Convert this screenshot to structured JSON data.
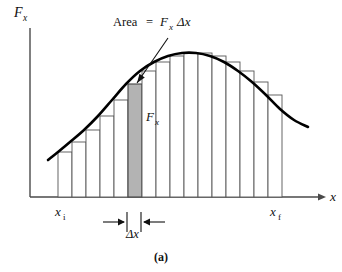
{
  "figure": {
    "caption": "(a)",
    "axis": {
      "y_label": "F",
      "y_label_sub": "x",
      "x_label": "x"
    },
    "annotations": {
      "area_label_prefix": "Area",
      "area_label_equals": "=",
      "area_label_force": "F",
      "area_label_force_sub": "x",
      "area_label_delta": "Δx",
      "bar_force_label": "F",
      "bar_force_label_sub": "x",
      "delta_x_label": "Δx",
      "x_initial": "x",
      "x_initial_sub": "i",
      "x_final": "x",
      "x_final_sub": "f"
    },
    "colors": {
      "curve": "#000000",
      "bar_outline": "#555555",
      "bar_fill": "#ffffff",
      "highlight_fill": "#b3b3b3",
      "highlight_outline": "#444444",
      "axis": "#4a4a4a",
      "text": "#111111",
      "background": "#ffffff"
    }
  },
  "chart_data": {
    "type": "area",
    "title": "",
    "xlabel": "x",
    "ylabel": "Fx",
    "grid": false,
    "legend": "none",
    "xlim": [
      0,
      342
    ],
    "ylim": [
      0,
      272
    ],
    "baseline_y": 197,
    "axis_origin": [
      30,
      197
    ],
    "y_axis_top": 28,
    "x_axis_end": 322,
    "curve_points": [
      [
        48,
        160
      ],
      [
        58,
        152
      ],
      [
        70,
        142
      ],
      [
        84,
        130
      ],
      [
        98,
        116
      ],
      [
        112,
        100
      ],
      [
        126,
        84
      ],
      [
        140,
        71
      ],
      [
        154,
        62
      ],
      [
        168,
        56
      ],
      [
        182,
        53
      ],
      [
        196,
        53
      ],
      [
        210,
        56
      ],
      [
        224,
        62
      ],
      [
        238,
        71
      ],
      [
        252,
        82
      ],
      [
        266,
        95
      ],
      [
        280,
        109
      ],
      [
        294,
        120
      ],
      [
        308,
        127
      ]
    ],
    "bars": {
      "x_start": 58,
      "x_end": 282,
      "width": 14,
      "count": 16,
      "tops": [
        152,
        142,
        130,
        116,
        100,
        84,
        71,
        62,
        56,
        53,
        53,
        56,
        62,
        71,
        82,
        95
      ],
      "highlight_index": 5
    },
    "markers": {
      "x_i_position": 66,
      "x_f_position": 282,
      "delta_x_left": 127,
      "delta_x_right": 141
    },
    "annotation_arrow": {
      "from": [
        168,
        38
      ],
      "to": [
        137,
        83
      ]
    }
  }
}
